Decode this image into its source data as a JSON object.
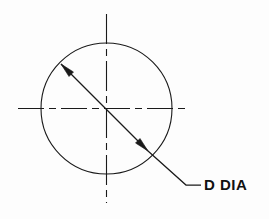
{
  "drawing": {
    "title": "Diameter dimension callout",
    "background_color": "#fdfdfd",
    "line_color": "#1a1a1a",
    "text_color": "#111111",
    "annotation": {
      "label": "D  DIA",
      "symbol_letter": "D",
      "abbreviation": "DIA",
      "meaning": "Diameter",
      "text_x": 204,
      "text_y": 190,
      "font_size": 15,
      "font_weight": "bold"
    },
    "circle": {
      "name": "feature-circle",
      "cx": 106.5,
      "cy": 108.5,
      "r": 65.5,
      "stroke_width": 1.1,
      "fill": "none"
    },
    "centerlines": {
      "horizontal": {
        "x1": 18,
        "y1": 108.5,
        "x2": 190,
        "y2": 108.5,
        "dash_pattern": "26 5 7 5",
        "stroke_width": 1.1
      },
      "vertical": {
        "x1": 106.5,
        "y1": 14,
        "x2": 106.5,
        "y2": 203,
        "dash_pattern": "30 5 7 5",
        "stroke_width": 1.1
      }
    },
    "dimension_line": {
      "name": "diameter-dimension-line",
      "x1": 61,
      "y1": 64,
      "x2": 148,
      "y2": 151,
      "stroke_width": 1.2,
      "arrow_start": {
        "x": 61,
        "y": 64,
        "angle_deg": 225
      },
      "arrow_end": {
        "x": 148,
        "y": 151,
        "angle_deg": 45
      },
      "arrow_length": 13,
      "arrow_half_width": 3.2
    },
    "leader_line": {
      "name": "leader-line",
      "points": "148,151 186,185 201,185",
      "stroke_width": 1.2
    }
  }
}
